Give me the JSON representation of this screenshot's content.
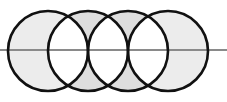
{
  "diagram": {
    "type": "overlapping-circles",
    "axis_line": {
      "y": 50,
      "x1": 0,
      "x2": 227,
      "color": "#888888"
    },
    "circles": [
      {
        "cx": 48,
        "cy": 51,
        "r": 40
      },
      {
        "cx": 88,
        "cy": 51,
        "r": 40
      },
      {
        "cx": 128,
        "cy": 51,
        "r": 40
      },
      {
        "cx": 168,
        "cy": 51,
        "r": 40
      }
    ],
    "colors": {
      "stroke": "#111111",
      "shade": "#e4e4e4",
      "background": "#ffffff"
    }
  }
}
